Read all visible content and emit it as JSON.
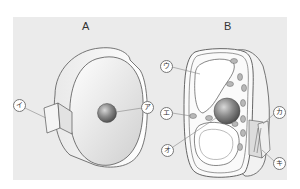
{
  "figure": {
    "panels": [
      {
        "id": "A",
        "title": "A",
        "labels": [
          {
            "key": "a",
            "text": "ア",
            "points_to": "nucleus"
          },
          {
            "key": "i",
            "text": "イ",
            "points_to": "cut-away surface of cell membrane"
          }
        ]
      },
      {
        "id": "B",
        "title": "B",
        "labels": [
          {
            "key": "u",
            "text": "ウ",
            "points_to": "vacuole"
          },
          {
            "key": "e",
            "text": "エ",
            "points_to": "chloroplast"
          },
          {
            "key": "o",
            "text": "オ",
            "points_to": "nucleus"
          },
          {
            "key": "ka",
            "text": "カ",
            "points_to": "cell membrane"
          },
          {
            "key": "ki",
            "text": "キ",
            "points_to": "cell wall"
          }
        ]
      }
    ],
    "colors": {
      "panel_bg": "#ebebeb",
      "cell_fill": "#f7f7f7",
      "outline": "#555555",
      "nucleus": "#7a7a7a",
      "chloroplast": "#b5b5b5",
      "leader_line": "#888888"
    }
  }
}
